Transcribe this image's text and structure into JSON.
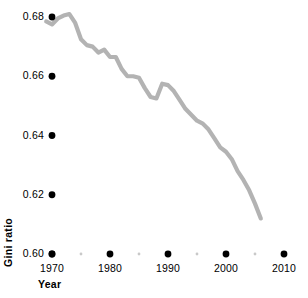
{
  "chart_data": {
    "type": "line",
    "title": "",
    "subtitle": "",
    "xlabel": "Year",
    "ylabel": "Gini ratio",
    "xlim": [
      1967,
      2011
    ],
    "ylim": [
      0.6,
      0.685
    ],
    "grid": false,
    "legend": false,
    "legend_position": "none",
    "line_color": "#b3b3b3",
    "marker_color": "#000000",
    "minor_marker_color": "#c9c9c9",
    "x_major_ticks": [
      1970,
      1980,
      1990,
      2000,
      2010
    ],
    "x_major_tick_labels": [
      "1970",
      "1980",
      "1990",
      "2000",
      "2010"
    ],
    "x_minor_ticks": [
      1975,
      1985,
      1995,
      2005
    ],
    "y_major_ticks": [
      0.6,
      0.62,
      0.64,
      0.66,
      0.68
    ],
    "y_major_tick_labels": [
      "0.60",
      "0.62",
      "0.64",
      "0.66",
      "0.68"
    ],
    "series": [
      {
        "name": "Gini ratio",
        "x": [
          1969,
          1970,
          1971,
          1972,
          1973,
          1974,
          1975,
          1976,
          1977,
          1978,
          1979,
          1980,
          1981,
          1982,
          1983,
          1984,
          1985,
          1986,
          1987,
          1988,
          1989,
          1990,
          1991,
          1992,
          1993,
          1994,
          1995,
          1996,
          1997,
          1998,
          1999,
          2000,
          2001,
          2002,
          2003,
          2004,
          2005,
          2006
        ],
        "y": [
          0.6785,
          0.6775,
          0.6795,
          0.6805,
          0.681,
          0.678,
          0.6725,
          0.6705,
          0.67,
          0.668,
          0.669,
          0.6665,
          0.6665,
          0.6625,
          0.66,
          0.66,
          0.6595,
          0.656,
          0.653,
          0.6525,
          0.6575,
          0.657,
          0.655,
          0.652,
          0.649,
          0.647,
          0.645,
          0.644,
          0.642,
          0.639,
          0.636,
          0.6345,
          0.632,
          0.628,
          0.625,
          0.6215,
          0.617,
          0.612
        ]
      }
    ]
  },
  "axis": {
    "ylabel_text": "Gini ratio",
    "xlabel_text": "Year"
  }
}
